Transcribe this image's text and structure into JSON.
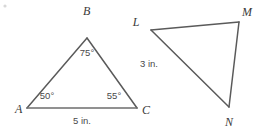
{
  "figure": {
    "background_color": "#ffffff",
    "stroke_color": "#5a5a5a",
    "stroke_color_light": "#6d6d6d",
    "text_color": "#3a3a3a",
    "label_color": "#4a4a4a",
    "triangles": [
      {
        "name": "triangle-abc",
        "vertices": [
          {
            "id": "A",
            "label": "A",
            "x": 27,
            "y": 108,
            "label_x": 15,
            "label_y": 113
          },
          {
            "id": "B",
            "label": "B",
            "x": 87,
            "y": 38,
            "label_x": 83,
            "label_y": 15
          },
          {
            "id": "C",
            "label": "C",
            "x": 137,
            "y": 108,
            "label_x": 142,
            "label_y": 114
          }
        ],
        "angles": [
          {
            "at": "A",
            "value": "50°",
            "x": 47,
            "y": 99
          },
          {
            "at": "B",
            "value": "75°",
            "x": 87,
            "y": 56
          },
          {
            "at": "C",
            "value": "55°",
            "x": 114,
            "y": 99
          }
        ],
        "side_measures": [
          {
            "side": "BC",
            "value": "3 in.",
            "x": 140,
            "y": 67
          },
          {
            "side": "AC",
            "value": "5 in.",
            "x": 82,
            "y": 124
          }
        ]
      },
      {
        "name": "triangle-lmn",
        "vertices": [
          {
            "id": "L",
            "label": "L",
            "x": 151,
            "y": 30,
            "label_x": 136,
            "label_y": 26
          },
          {
            "id": "M",
            "label": "M",
            "x": 239,
            "y": 22,
            "label_x": 241,
            "label_y": 16
          },
          {
            "id": "N",
            "label": "N",
            "x": 229,
            "y": 107,
            "label_x": 224,
            "label_y": 126
          }
        ],
        "angles": [],
        "side_measures": []
      }
    ]
  }
}
